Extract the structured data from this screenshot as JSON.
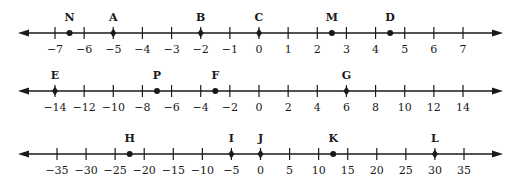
{
  "figure": {
    "colors": {
      "ink": "#1a1a1a",
      "background": "#ffffff"
    }
  },
  "number_lines": [
    {
      "id": "line-1",
      "y": 33,
      "x_start": 18,
      "x_end": 503,
      "min": -7,
      "max": 7,
      "step": 1,
      "x_min_px": 55,
      "x_max_px": 463,
      "ticks": [
        "−7",
        "−6",
        "−5",
        "−4",
        "−3",
        "−2",
        "−1",
        "0",
        "1",
        "2",
        "3",
        "4",
        "5",
        "6",
        "7"
      ],
      "tick_values": [
        -7,
        -6,
        -5,
        -4,
        -3,
        -2,
        -1,
        0,
        1,
        2,
        3,
        4,
        5,
        6,
        7
      ],
      "points": [
        {
          "label": "N",
          "value": -6.5
        },
        {
          "label": "A",
          "value": -5
        },
        {
          "label": "B",
          "value": -2
        },
        {
          "label": "C",
          "value": 0
        },
        {
          "label": "M",
          "value": 2.5
        },
        {
          "label": "D",
          "value": 4.5
        }
      ]
    },
    {
      "id": "line-2",
      "y": 91,
      "x_start": 18,
      "x_end": 503,
      "min": -14,
      "max": 14,
      "step": 2,
      "x_min_px": 55,
      "x_max_px": 463,
      "ticks": [
        "−14",
        "−12",
        "−10",
        "−8",
        "−6",
        "−4",
        "−2",
        "0",
        "2",
        "4",
        "6",
        "8",
        "10",
        "12",
        "14"
      ],
      "tick_values": [
        -14,
        -12,
        -10,
        -8,
        -6,
        -4,
        -2,
        0,
        2,
        4,
        6,
        8,
        10,
        12,
        14
      ],
      "points": [
        {
          "label": "E",
          "value": -14
        },
        {
          "label": "P",
          "value": -7
        },
        {
          "label": "F",
          "value": -3
        },
        {
          "label": "G",
          "value": 6
        }
      ]
    },
    {
      "id": "line-3",
      "y": 154,
      "x_start": 18,
      "x_end": 503,
      "min": -35,
      "max": 35,
      "step": 5,
      "x_min_px": 57,
      "x_max_px": 464,
      "ticks": [
        "−35",
        "−30",
        "−25",
        "−20",
        "−15",
        "−10",
        "−5",
        "0",
        "5",
        "10",
        "15",
        "20",
        "25",
        "30",
        "35"
      ],
      "tick_values": [
        -35,
        -30,
        -25,
        -20,
        -15,
        -10,
        -5,
        0,
        5,
        10,
        15,
        20,
        25,
        30,
        35
      ],
      "points": [
        {
          "label": "H",
          "value": -22.5
        },
        {
          "label": "I",
          "value": -5
        },
        {
          "label": "J",
          "value": 0
        },
        {
          "label": "K",
          "value": 12.5
        },
        {
          "label": "L",
          "value": 30
        }
      ]
    }
  ]
}
